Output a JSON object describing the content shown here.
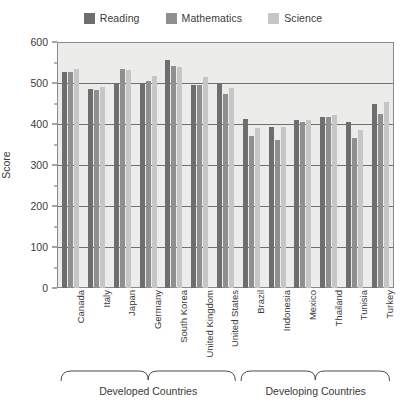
{
  "chart_data": {
    "type": "bar",
    "title": "",
    "subtitle": "",
    "xlabel": "",
    "ylabel": "Score",
    "ylim": [
      0,
      600
    ],
    "ytick_step": 100,
    "ytick_labels": [
      "0",
      "100",
      "200",
      "300",
      "400",
      "500",
      "600"
    ],
    "grid": true,
    "legend_position": "top-center",
    "categories": [
      "Canada",
      "Italy",
      "Japan",
      "Germany",
      "South Korea",
      "United Kingdom",
      "United States",
      "Brazil",
      "Indonesia",
      "Mexico",
      "Thailand",
      "Tunisia",
      "Turkey"
    ],
    "series": [
      {
        "name": "Reading",
        "color": "#6e6e6e",
        "values": [
          528,
          486,
          498,
          497,
          556,
          495,
          500,
          412,
          393,
          410,
          417,
          404,
          448
        ]
      },
      {
        "name": "Mathematics",
        "color": "#8f8f8f",
        "values": [
          527,
          483,
          534,
          504,
          542,
          495,
          474,
          370,
          360,
          406,
          417,
          365,
          424
        ]
      },
      {
        "name": "Science",
        "color": "#c6c6c6",
        "values": [
          534,
          491,
          531,
          516,
          538,
          515,
          489,
          390,
          393,
          410,
          421,
          386,
          454
        ]
      }
    ],
    "group_brackets": [
      {
        "label": "Developed Countries",
        "categories_from": "Canada",
        "categories_to": "United States"
      },
      {
        "label": "Developing Countries",
        "categories_from": "Brazil",
        "categories_to": "Turkey"
      }
    ]
  },
  "legend": {
    "items": [
      {
        "label": "Reading",
        "color": "#6e6e6e"
      },
      {
        "label": "Mathematics",
        "color": "#8f8f8f"
      },
      {
        "label": "Science",
        "color": "#c6c6c6"
      }
    ]
  },
  "axes": {
    "y_title": "Score"
  }
}
